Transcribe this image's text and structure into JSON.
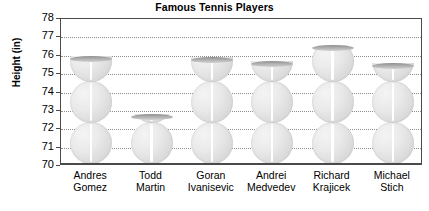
{
  "chart_data": {
    "type": "bar",
    "title": "Famous Tennis Players",
    "xlabel": "",
    "ylabel": "Height (in)",
    "categories": [
      "Andres Gomez",
      "Todd Martin",
      "Goran Ivanisevic",
      "Andrei Medvedev",
      "Richard Krajicek",
      "Michael Stich"
    ],
    "category_lines": [
      [
        "Andres",
        "Gomez"
      ],
      [
        "Todd",
        "Martin"
      ],
      [
        "Goran",
        "Ivanisevic"
      ],
      [
        "Andrei",
        "Medvedev"
      ],
      [
        "Richard",
        "Krajicek"
      ],
      [
        "Michael",
        "Stich"
      ]
    ],
    "values": [
      75.9,
      72.7,
      75.8,
      75.6,
      76.5,
      75.5
    ],
    "ylim": [
      70,
      78
    ],
    "yticks": [
      70,
      71,
      72,
      73,
      74,
      75,
      76,
      77,
      78
    ],
    "grid": true,
    "legend": "none",
    "bar_style": "tennis-ball-stack"
  },
  "colors": {
    "axis": "#4a4a4a",
    "gridline": "#8c8c8c",
    "ball_fill": "#e6e6e6",
    "bar_cap": "#9a9a9a",
    "text": "#000000",
    "background": "#ffffff"
  }
}
